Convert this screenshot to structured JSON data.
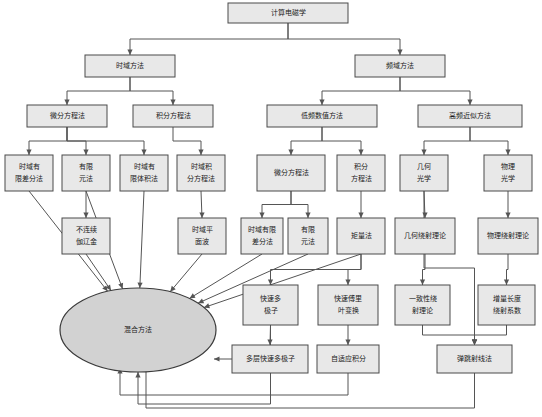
{
  "diagram": {
    "colors": {
      "box_fill": "#e8e8e8",
      "box_stroke": "#4a4a4a",
      "ellipse_fill": "#d2d2d2",
      "edge": "#555555",
      "background": "#ffffff",
      "text": "#1a1a1a"
    },
    "nodes": {
      "root": {
        "label": "计算电磁学",
        "x": 228,
        "y": 3,
        "w": 120,
        "h": 20,
        "shape": "rect",
        "lines": [
          "计算电磁学"
        ]
      },
      "time_domain": {
        "label": "时域方法",
        "x": 85,
        "y": 55,
        "w": 90,
        "h": 22,
        "shape": "rect",
        "lines": [
          "时域方法"
        ]
      },
      "freq_domain": {
        "label": "频域方法",
        "x": 355,
        "y": 55,
        "w": 90,
        "h": 22,
        "shape": "rect",
        "lines": [
          "频域方法"
        ]
      },
      "td_diff_eq": {
        "label": "微分方程法",
        "x": 27,
        "y": 105,
        "w": 80,
        "h": 22,
        "shape": "rect",
        "lines": [
          "微分方程法"
        ]
      },
      "td_int_eq": {
        "label": "积分方程法",
        "x": 133,
        "y": 105,
        "w": 80,
        "h": 22,
        "shape": "rect",
        "lines": [
          "积分方程法"
        ]
      },
      "low_freq": {
        "label": "低频数值方法",
        "x": 267,
        "y": 105,
        "w": 110,
        "h": 22,
        "shape": "rect",
        "lines": [
          "低频数值方法"
        ]
      },
      "high_freq": {
        "label": "高频近似方法",
        "x": 418,
        "y": 105,
        "w": 104,
        "h": 22,
        "shape": "rect",
        "lines": [
          "高频近似方法"
        ]
      },
      "fdtd": {
        "label": "时域有限差分法",
        "x": 5,
        "y": 155,
        "w": 48,
        "h": 36,
        "shape": "rect",
        "lines": [
          "时域有",
          "限差分法"
        ]
      },
      "fem_td": {
        "label": "有限元法",
        "x": 62,
        "y": 155,
        "w": 48,
        "h": 36,
        "shape": "rect",
        "lines": [
          "有限",
          "元法"
        ]
      },
      "fvtd": {
        "label": "时域有限体积法",
        "x": 120,
        "y": 155,
        "w": 48,
        "h": 36,
        "shape": "rect",
        "lines": [
          "时域有",
          "限体积法"
        ]
      },
      "tdie": {
        "label": "时域积分方程法",
        "x": 177,
        "y": 155,
        "w": 48,
        "h": 36,
        "shape": "rect",
        "lines": [
          "时域积",
          "分方程法"
        ]
      },
      "lf_diff_eq": {
        "label": "微分方程法",
        "x": 257,
        "y": 155,
        "w": 68,
        "h": 36,
        "shape": "rect",
        "lines": [
          "微分方程法"
        ]
      },
      "lf_int_eq": {
        "label": "积分方程法",
        "x": 337,
        "y": 155,
        "w": 48,
        "h": 36,
        "shape": "rect",
        "lines": [
          "积分",
          "方程法"
        ]
      },
      "geo_optics": {
        "label": "几何光学",
        "x": 400,
        "y": 155,
        "w": 48,
        "h": 36,
        "shape": "rect",
        "lines": [
          "几何",
          "光学"
        ]
      },
      "phys_optics": {
        "label": "物理光学",
        "x": 484,
        "y": 155,
        "w": 48,
        "h": 36,
        "shape": "rect",
        "lines": [
          "物理",
          "光学"
        ]
      },
      "dg": {
        "label": "不连续伽辽金",
        "x": 62,
        "y": 218,
        "w": 48,
        "h": 36,
        "shape": "rect",
        "lines": [
          "不连续",
          "伽辽金"
        ]
      },
      "td_plane_wave": {
        "label": "时域平面波",
        "x": 178,
        "y": 218,
        "w": 48,
        "h": 36,
        "shape": "rect",
        "lines": [
          "时域平",
          "面波"
        ]
      },
      "lf_fdtd": {
        "label": "时域有限差分法",
        "x": 241,
        "y": 218,
        "w": 42,
        "h": 36,
        "shape": "rect",
        "lines": [
          "时域有限",
          "差分法"
        ]
      },
      "lf_fem": {
        "label": "有限元法",
        "x": 288,
        "y": 218,
        "w": 40,
        "h": 36,
        "shape": "rect",
        "lines": [
          "有限",
          "元法"
        ]
      },
      "mom": {
        "label": "矩量法",
        "x": 337,
        "y": 218,
        "w": 48,
        "h": 36,
        "shape": "rect",
        "lines": [
          "矩量法"
        ]
      },
      "gtd": {
        "label": "几何绕射理论",
        "x": 395,
        "y": 218,
        "w": 60,
        "h": 36,
        "shape": "rect",
        "lines": [
          "几何绕射理论"
        ]
      },
      "ptd": {
        "label": "物理绕射理论",
        "x": 478,
        "y": 218,
        "w": 60,
        "h": 36,
        "shape": "rect",
        "lines": [
          "物理绕射理论"
        ]
      },
      "fmm": {
        "label": "快速多极子",
        "x": 243,
        "y": 285,
        "w": 55,
        "h": 40,
        "shape": "rect",
        "lines": [
          "快速多",
          "极子"
        ]
      },
      "fft": {
        "label": "快速傅里叶变换",
        "x": 318,
        "y": 285,
        "w": 60,
        "h": 40,
        "shape": "rect",
        "lines": [
          "快速傅里",
          "叶变换"
        ]
      },
      "utd": {
        "label": "一致性绕射理论",
        "x": 395,
        "y": 285,
        "w": 55,
        "h": 40,
        "shape": "rect",
        "lines": [
          "一致性绕",
          "射理论"
        ]
      },
      "ildc": {
        "label": "增量长度绕射系数",
        "x": 478,
        "y": 285,
        "w": 57,
        "h": 40,
        "shape": "rect",
        "lines": [
          "增量长度",
          "绕射系数"
        ]
      },
      "mlfma": {
        "label": "多层快速多极子",
        "x": 232,
        "y": 345,
        "w": 76,
        "h": 28,
        "shape": "rect",
        "lines": [
          "多层快速多极子"
        ]
      },
      "aim": {
        "label": "自适应积分",
        "x": 317,
        "y": 345,
        "w": 62,
        "h": 28,
        "shape": "rect",
        "lines": [
          "自适应积分"
        ]
      },
      "sbr": {
        "label": "弹跳射线法",
        "x": 437,
        "y": 345,
        "w": 75,
        "h": 28,
        "shape": "rect",
        "lines": [
          "弹跳射线法"
        ]
      },
      "hybrid": {
        "label": "混合方法",
        "cx": 138,
        "cy": 330,
        "rx": 78,
        "ry": 42,
        "shape": "ellipse",
        "lines": [
          "混合方法"
        ]
      }
    },
    "edges": [
      {
        "from": "root",
        "to": "time_domain"
      },
      {
        "from": "root",
        "to": "freq_domain"
      },
      {
        "from": "time_domain",
        "to": "td_diff_eq"
      },
      {
        "from": "time_domain",
        "to": "td_int_eq"
      },
      {
        "from": "freq_domain",
        "to": "low_freq"
      },
      {
        "from": "freq_domain",
        "to": "high_freq"
      },
      {
        "from": "td_diff_eq",
        "to": "fdtd"
      },
      {
        "from": "td_diff_eq",
        "to": "fem_td"
      },
      {
        "from": "td_diff_eq",
        "to": "fvtd"
      },
      {
        "from": "td_int_eq",
        "to": "tdie"
      },
      {
        "from": "low_freq",
        "to": "lf_diff_eq"
      },
      {
        "from": "low_freq",
        "to": "lf_int_eq"
      },
      {
        "from": "high_freq",
        "to": "geo_optics"
      },
      {
        "from": "high_freq",
        "to": "phys_optics"
      },
      {
        "from": "fem_td",
        "to": "dg"
      },
      {
        "from": "tdie",
        "to": "td_plane_wave"
      },
      {
        "from": "lf_diff_eq",
        "to": "lf_fdtd"
      },
      {
        "from": "lf_diff_eq",
        "to": "lf_fem"
      },
      {
        "from": "lf_int_eq",
        "to": "mom"
      },
      {
        "from": "geo_optics",
        "to": "gtd"
      },
      {
        "from": "phys_optics",
        "to": "ptd"
      },
      {
        "from": "mom",
        "to": "fmm"
      },
      {
        "from": "mom",
        "to": "fft"
      },
      {
        "from": "gtd",
        "to": "utd"
      },
      {
        "from": "ptd",
        "to": "ildc"
      },
      {
        "from": "fmm",
        "to": "mlfma"
      },
      {
        "from": "fft",
        "to": "aim"
      },
      {
        "from": "geo_optics",
        "to": "sbr"
      },
      {
        "from": "utd",
        "to": "sbr"
      },
      {
        "from": "ildc",
        "to": "sbr"
      },
      {
        "from": "fdtd",
        "to": "hybrid"
      },
      {
        "from": "fem_td",
        "to": "hybrid"
      },
      {
        "from": "fvtd",
        "to": "hybrid"
      },
      {
        "from": "dg",
        "to": "hybrid"
      },
      {
        "from": "td_plane_wave",
        "to": "hybrid"
      },
      {
        "from": "lf_fdtd",
        "to": "hybrid"
      },
      {
        "from": "lf_fem",
        "to": "hybrid"
      },
      {
        "from": "mom",
        "to": "hybrid"
      },
      {
        "from": "fmm",
        "to": "hybrid"
      },
      {
        "from": "mlfma",
        "to": "hybrid"
      },
      {
        "from": "aim",
        "to": "hybrid"
      },
      {
        "from": "sbr",
        "to": "hybrid"
      }
    ]
  }
}
